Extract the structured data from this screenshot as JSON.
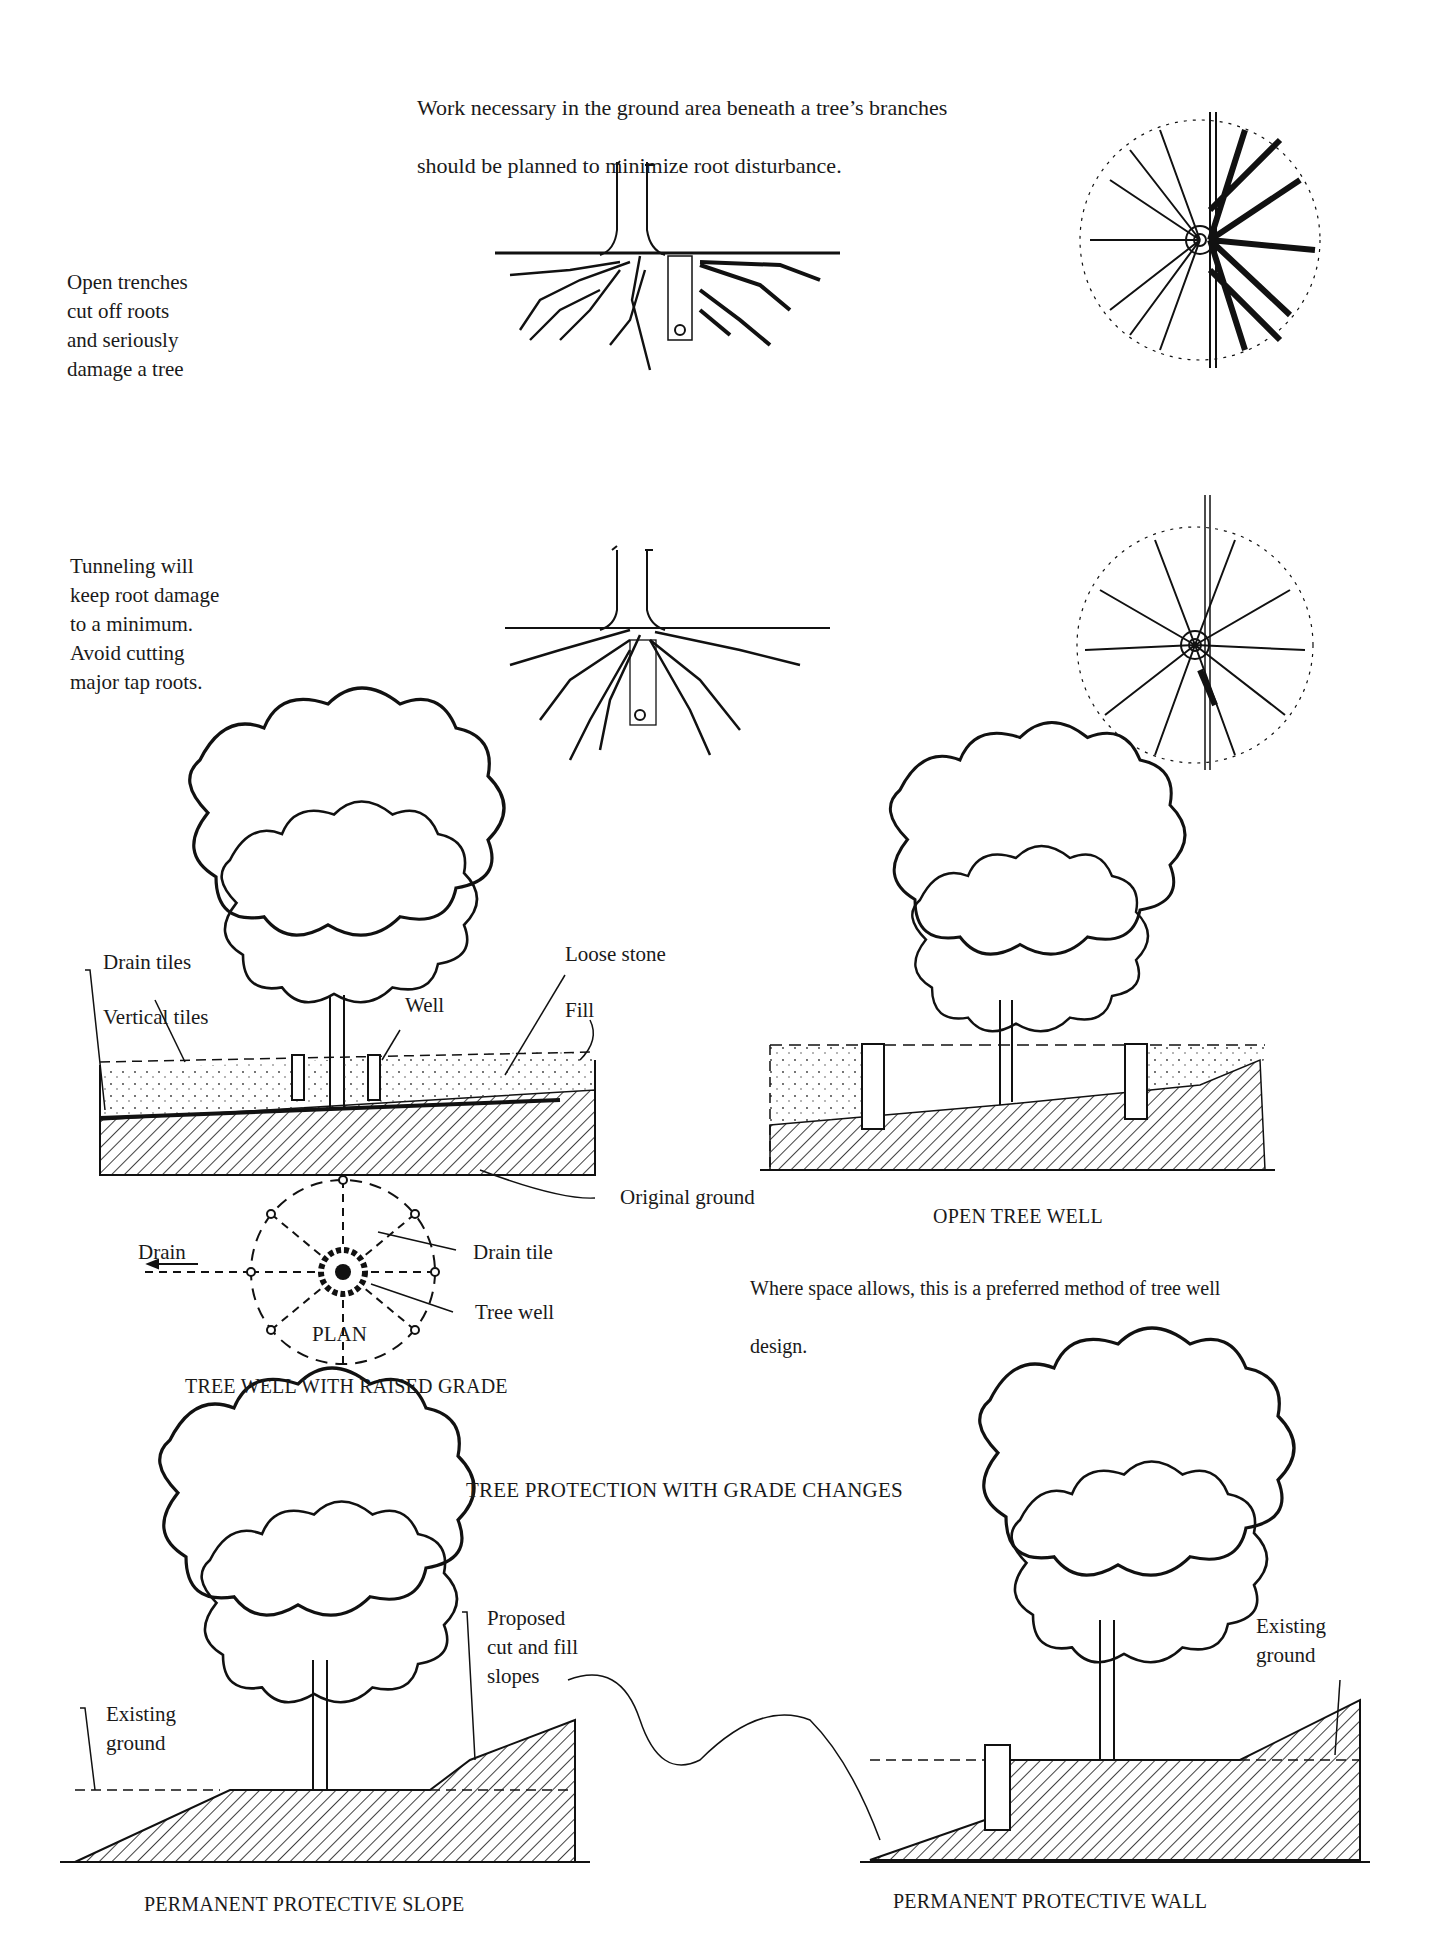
{
  "intro": {
    "line1": "Work necessary in the ground area beneath a tree’s branches",
    "line2": "should be planned to minimize root disturbance."
  },
  "trench_note": "Open trenches\ncut off roots\nand seriously\ndamage a tree",
  "tunnel_note": "Tunneling will\nkeep root damage\nto a minimum.\nAvoid cutting\nmajor tap roots.",
  "raised_grade": {
    "labels": {
      "drain_tiles": "Drain tiles",
      "vertical_tiles": "Vertical tiles",
      "well": "Well",
      "loose_stone": "Loose stone",
      "fill": "Fill",
      "original_ground": "Original ground"
    },
    "plan": {
      "drain": "Drain",
      "drain_tile": "Drain tile",
      "tree_well": "Tree well",
      "plan_label": "PLAN"
    },
    "caption": "TREE WELL WITH RAISED GRADE"
  },
  "open_well": {
    "caption": "OPEN TREE WELL",
    "note_line1": "Where space allows, this is a preferred method of tree well",
    "note_line2": "design."
  },
  "section_title": "TREE PROTECTION WITH GRADE CHANGES",
  "slope": {
    "existing_ground": "Existing\nground",
    "proposed": "Proposed\ncut and fill\nslopes",
    "caption": "PERMANENT PROTECTIVE SLOPE"
  },
  "wall": {
    "existing_ground": "Existing\nground",
    "caption": "PERMANENT PROTECTIVE WALL"
  }
}
